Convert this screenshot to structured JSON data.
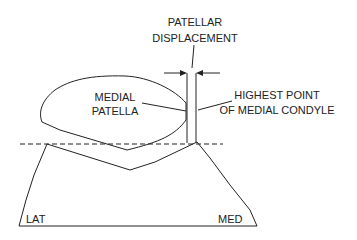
{
  "labels": {
    "patellar_displacement_line1": "PATELLAR",
    "patellar_displacement_line2": "DISPLACEMENT",
    "medial_patella_line1": "MEDIAL",
    "medial_patella_line2": "PATELLA",
    "highest_point_line1": "HIGHEST POINT",
    "highest_point_line2": "OF MEDIAL CONDYLE",
    "lat": "LAT",
    "med": "MED"
  },
  "colors": {
    "stroke": "#222222",
    "background": "#ffffff"
  }
}
